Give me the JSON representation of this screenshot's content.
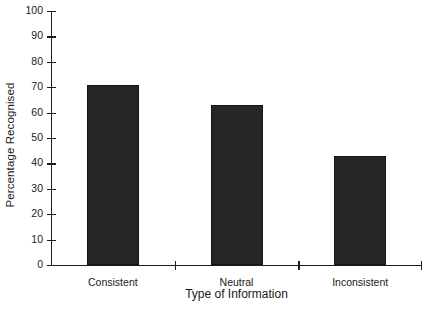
{
  "chart_data": {
    "type": "bar",
    "title": "",
    "categories": [
      "Consistent",
      "Neutral",
      "Inconsistent"
    ],
    "values": [
      71,
      63,
      43
    ],
    "xlabel": "Type of Information",
    "ylabel": "Percentage Recognised",
    "ylim": [
      0,
      100
    ],
    "ytick_step": 10,
    "yticks": [
      0,
      10,
      20,
      30,
      40,
      50,
      60,
      70,
      80,
      90,
      100
    ],
    "ytick_labels": [
      "0",
      "10",
      "20",
      "30",
      "40",
      "50",
      "60",
      "70",
      "80",
      "90",
      "100"
    ],
    "grid": false,
    "legend": false,
    "bar_color": "#262626",
    "axis_color": "#1d1d1d",
    "background": "#ffffff"
  },
  "caption_fragment": ""
}
